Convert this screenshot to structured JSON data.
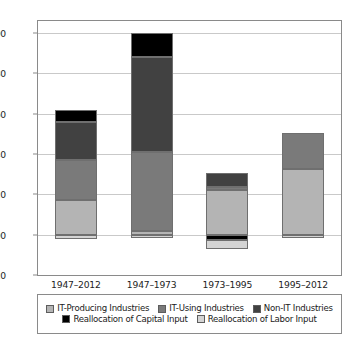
{
  "chart_data": {
    "type": "bar",
    "stacked": true,
    "title": "",
    "subtitle": "",
    "xlabel": "",
    "ylabel": "",
    "categories": [
      "1947–2012",
      "1947–1973",
      "1973–1995",
      "1995–2012"
    ],
    "ylim": [
      -0.2,
      1.06
    ],
    "yticks": [
      -0.2,
      0.0,
      0.2,
      0.4,
      0.6,
      0.8,
      1.0
    ],
    "ytick_labels": [
      "-0.20",
      "0.00",
      "0.20",
      "0.40",
      "0.60",
      "0.80",
      "1.00"
    ],
    "grid": true,
    "legend_position": "bottom",
    "series": [
      {
        "name": "IT-Producing Industries",
        "color": "#b4b4b4",
        "values": [
          0.17,
          0.02,
          0.22,
          0.325
        ]
      },
      {
        "name": "IT-Using Industries",
        "color": "#7a7a7a",
        "values": [
          0.2,
          0.39,
          0.015,
          0.18
        ]
      },
      {
        "name": "Non-IT Industries",
        "color": "#414141",
        "values": [
          0.19,
          0.47,
          0.07,
          0.0
        ]
      },
      {
        "name": "Reallocation of Capital Input",
        "color": "#000000",
        "values": [
          0.06,
          0.12,
          -0.025,
          0.0
        ]
      },
      {
        "name": "Reallocation of Labor Input",
        "color": "#d4d4d4",
        "values": [
          -0.02,
          -0.015,
          -0.045,
          -0.015
        ]
      }
    ],
    "bar_totals": [
      0.62,
      1.0,
      0.305,
      0.505
    ]
  },
  "legend": {
    "row1": [
      {
        "label": "IT-Producing Industries",
        "color": "#b4b4b4"
      },
      {
        "label": "IT-Using Industries",
        "color": "#7a7a7a"
      },
      {
        "label": "Non-IT Industries",
        "color": "#414141"
      }
    ],
    "row2": [
      {
        "label": "Reallocation of Capital Input",
        "color": "#000000"
      },
      {
        "label": "Reallocation of Labor Input",
        "color": "#d4d4d4"
      }
    ]
  }
}
